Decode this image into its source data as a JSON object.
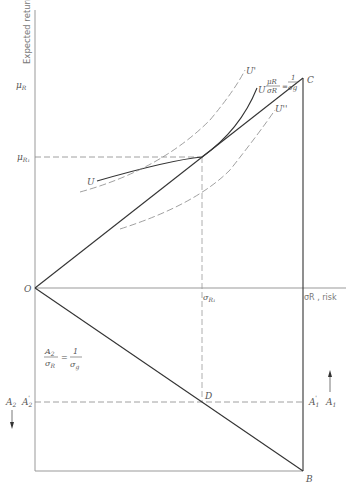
{
  "diagram": {
    "axis_labels": {
      "y_axis": "Expected return",
      "x_axis": "σR , risk"
    },
    "points": {
      "origin": "O",
      "C": "C",
      "B": "B",
      "D": "D"
    },
    "y_ticks": {
      "mu_R": "μR",
      "mu_R1": "μR1",
      "A2_prime": "A'2"
    },
    "x_ticks": {
      "sigma_R1": "σR1"
    },
    "right_ticks": {
      "A1_prime": "A'1"
    },
    "arrows": {
      "A1": "A1",
      "A2": "A2"
    },
    "curves": {
      "U": "U",
      "U_prime": "U'",
      "U_double_prime": "U''"
    },
    "equations": {
      "upper_line": {
        "num": "μR",
        "den": "σR",
        "rhs_num": "1",
        "rhs_den": "σg"
      },
      "lower_line": {
        "num": "A2",
        "den": "σR",
        "rhs_num": "1",
        "rhs_den": "σg"
      }
    },
    "colors": {
      "solid": "#333333",
      "dashed": "#888888",
      "axis": "#999999",
      "text": "#555555"
    }
  }
}
